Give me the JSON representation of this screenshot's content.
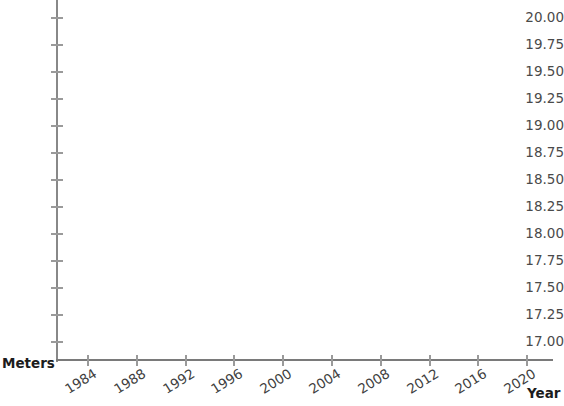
{
  "chart_data": {
    "type": "line",
    "title": "",
    "subtitle": "",
    "xlabel": "Year",
    "ylabel": "Meters",
    "xlim": [
      1982,
      2022
    ],
    "ylim": [
      17.0,
      20.0
    ],
    "xticks": [
      1984,
      1988,
      1992,
      1996,
      2000,
      2004,
      2008,
      2012,
      2016,
      2020
    ],
    "xtick_labels": [
      "1984",
      "1988",
      "1992",
      "1996",
      "2000",
      "2004",
      "2008",
      "2012",
      "2016",
      "2020"
    ],
    "yticks": [
      17.0,
      17.25,
      17.5,
      17.75,
      18.0,
      18.25,
      18.5,
      18.75,
      19.0,
      19.25,
      19.5,
      19.75,
      20.0
    ],
    "ytick_labels": [
      "17.00",
      "17.25",
      "17.50",
      "17.75",
      "18.00",
      "18.25",
      "18.50",
      "18.75",
      "19.00",
      "19.25",
      "19.50",
      "19.75",
      "20.00"
    ],
    "grid": false,
    "legend": null,
    "legend_position": "none",
    "series": [],
    "x": [],
    "values": [],
    "annotations": []
  },
  "axes": {
    "x_title": "Year",
    "y_title": "Meters",
    "x_tick_rotation_deg": -32
  },
  "colors": {
    "background": "#ffffff",
    "axis_line": "#888888",
    "x_axis_line": "#7a7a7a",
    "tick_mark": "#9a9a9a",
    "tick_label": "#4a4a4a",
    "axis_title": "#1c1c1c"
  }
}
